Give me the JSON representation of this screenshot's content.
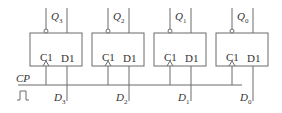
{
  "diagram": {
    "type": "4-bit register of D flip-flops",
    "clock_label": "CP",
    "clock_symbol": "pulse-icon",
    "flip_flops": [
      {
        "id": "ff3",
        "clock_pin": "C1",
        "data_pin": "D1",
        "output_base": "Q",
        "output_sub": "3",
        "input_base": "D",
        "input_sub": "3"
      },
      {
        "id": "ff2",
        "clock_pin": "C1",
        "data_pin": "D1",
        "output_base": "Q",
        "output_sub": "2",
        "input_base": "D",
        "input_sub": "2"
      },
      {
        "id": "ff1",
        "clock_pin": "C1",
        "data_pin": "D1",
        "output_base": "Q",
        "output_sub": "1",
        "input_base": "D",
        "input_sub": "1"
      },
      {
        "id": "ff0",
        "clock_pin": "C1",
        "data_pin": "D1",
        "output_base": "Q",
        "output_sub": "0",
        "input_base": "D",
        "input_sub": "0"
      }
    ],
    "colors": {
      "line": "#6b6b6b",
      "text": "#333333",
      "background": "#ffffff"
    }
  }
}
